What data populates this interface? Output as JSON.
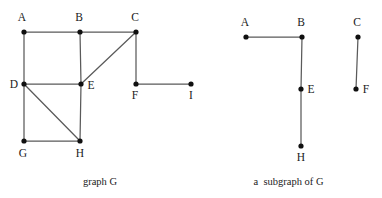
{
  "figure": {
    "width": 382,
    "height": 198,
    "background_color": "#ffffff",
    "edge_color": "#5a5a5a",
    "vertex_color": "#101010",
    "label_color": "#1a1a1a"
  },
  "graphs": [
    {
      "id": "graph-g",
      "caption": "graph G",
      "vertices": [
        {
          "id": "A",
          "label": "A",
          "x": 24,
          "y": 32,
          "label_x": 22,
          "label_y": 21,
          "label_anchor": "middle"
        },
        {
          "id": "B",
          "label": "B",
          "x": 80,
          "y": 32,
          "label_x": 79,
          "label_y": 21,
          "label_anchor": "middle"
        },
        {
          "id": "C",
          "label": "C",
          "x": 136,
          "y": 32,
          "label_x": 135,
          "label_y": 21,
          "label_anchor": "middle"
        },
        {
          "id": "D",
          "label": "D",
          "x": 24,
          "y": 84,
          "label_x": 14,
          "label_y": 88,
          "label_anchor": "middle"
        },
        {
          "id": "E",
          "label": "E",
          "x": 81,
          "y": 84,
          "label_x": 91,
          "label_y": 89,
          "label_anchor": "middle"
        },
        {
          "id": "F",
          "label": "F",
          "x": 136,
          "y": 84,
          "label_x": 135,
          "label_y": 99,
          "label_anchor": "middle"
        },
        {
          "id": "I",
          "label": "I",
          "x": 191,
          "y": 84,
          "label_x": 191,
          "label_y": 99,
          "label_anchor": "middle"
        },
        {
          "id": "G",
          "label": "G",
          "x": 24,
          "y": 141,
          "label_x": 23,
          "label_y": 157,
          "label_anchor": "middle"
        },
        {
          "id": "H",
          "label": "H",
          "x": 80,
          "y": 141,
          "label_x": 80,
          "label_y": 157,
          "label_anchor": "middle"
        }
      ],
      "edges": [
        {
          "from": "A",
          "to": "B"
        },
        {
          "from": "B",
          "to": "C"
        },
        {
          "from": "A",
          "to": "D"
        },
        {
          "from": "B",
          "to": "E"
        },
        {
          "from": "C",
          "to": "E"
        },
        {
          "from": "C",
          "to": "F"
        },
        {
          "from": "D",
          "to": "E"
        },
        {
          "from": "D",
          "to": "G"
        },
        {
          "from": "D",
          "to": "H"
        },
        {
          "from": "E",
          "to": "H"
        },
        {
          "from": "G",
          "to": "H"
        },
        {
          "from": "F",
          "to": "I"
        }
      ]
    },
    {
      "id": "subgraph-g",
      "caption": "a  subgraph of G",
      "vertices": [
        {
          "id": "A",
          "label": "A",
          "x": 246,
          "y": 37,
          "label_x": 245,
          "label_y": 26,
          "label_anchor": "middle"
        },
        {
          "id": "B",
          "label": "B",
          "x": 302,
          "y": 37,
          "label_x": 301,
          "label_y": 26,
          "label_anchor": "middle"
        },
        {
          "id": "C",
          "label": "C",
          "x": 358,
          "y": 37,
          "label_x": 357,
          "label_y": 26,
          "label_anchor": "middle"
        },
        {
          "id": "E",
          "label": "E",
          "x": 301,
          "y": 89,
          "label_x": 311,
          "label_y": 93,
          "label_anchor": "middle"
        },
        {
          "id": "F",
          "label": "F",
          "x": 356,
          "y": 89,
          "label_x": 366,
          "label_y": 93,
          "label_anchor": "middle"
        },
        {
          "id": "H",
          "label": "H",
          "x": 301,
          "y": 146,
          "label_x": 301,
          "label_y": 161,
          "label_anchor": "middle"
        }
      ],
      "edges": [
        {
          "from": "A",
          "to": "B"
        },
        {
          "from": "B",
          "to": "E"
        },
        {
          "from": "E",
          "to": "H"
        },
        {
          "from": "C",
          "to": "F"
        }
      ]
    }
  ]
}
